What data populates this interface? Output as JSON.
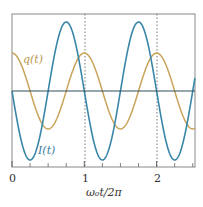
{
  "chart_data": {
    "type": "line",
    "title": "",
    "xlabel": "ω₀t/2π",
    "ylabel": "",
    "xlim": [
      0,
      2.53
    ],
    "ylim": [
      -1,
      1
    ],
    "x_ticks": [
      "0",
      "1",
      "2"
    ],
    "minor_ticks": [
      0.25,
      0.5,
      0.75,
      1.25,
      1.5,
      1.75,
      2.25,
      2.5
    ],
    "grid": false,
    "reference_lines": [
      {
        "x": 1,
        "style": "dotted"
      },
      {
        "x": 2,
        "style": "dotted"
      },
      {
        "y": 0,
        "style": "solid"
      }
    ],
    "series": [
      {
        "name": "q(t)",
        "label": "q(t)",
        "color": "#c8a45a",
        "function": "0.55*cos(2πx)",
        "amplitude": 0.55
      },
      {
        "name": "I(t)",
        "label": "I(t)",
        "color": "#3a86a8",
        "function": "-1.0*sin(2πx)",
        "amplitude": 1.0
      }
    ]
  },
  "labels": {
    "q": "q(t)",
    "I": "I(t)",
    "x0": "0",
    "x1": "1",
    "x2": "2",
    "xlabel": "ω₀t/2π"
  }
}
